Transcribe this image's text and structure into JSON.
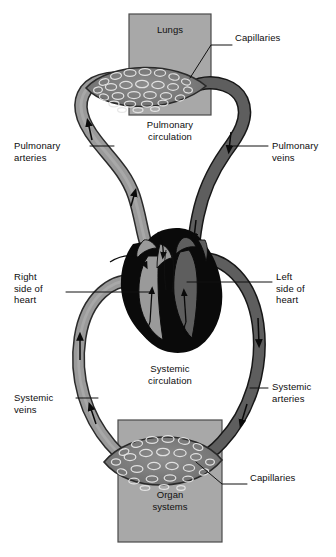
{
  "figure": {
    "type": "anatomical-flow-diagram"
  },
  "colors": {
    "oxygen_poor_blue": "#9a9a9a",
    "oxygen_rich_red": "#5e5e5e",
    "heart_dark": "#0a0a0a",
    "organ_box_fill": "#a8a8a8",
    "organ_box_stroke": "#4a4a4a",
    "capillary_bed_fill": "#7d7d7d",
    "text": "#0d0d0d",
    "leader_line": "#111111",
    "background": "#ffffff"
  },
  "boxes": [
    {
      "name": "lungs-box",
      "label": "Lungs",
      "x": 129,
      "y": 14,
      "w": 82,
      "h": 101
    },
    {
      "name": "organ-systems-box",
      "label": "Organ\nsystems",
      "x": 118,
      "y": 420,
      "w": 104,
      "h": 122
    }
  ],
  "circulation_labels": [
    {
      "name": "pulmonary-circulation-label",
      "text": "Pulmonary\ncirculation",
      "x": 132,
      "y": 119,
      "w": 76
    },
    {
      "name": "systemic-circulation-label",
      "text": "Systemic\ncirculation",
      "x": 132,
      "y": 363,
      "w": 76
    }
  ],
  "callouts": [
    {
      "name": "capillaries-lungs",
      "text": "Capillaries",
      "side": "right",
      "text_x": 235,
      "text_y": 38,
      "leader": [
        [
          232,
          45
        ],
        [
          211,
          45
        ],
        [
          190,
          78
        ]
      ]
    },
    {
      "name": "pulmonary-arteries",
      "text": "Pulmonary\narteries",
      "side": "left",
      "text_x": 14,
      "text_y": 140,
      "text_w": 74,
      "leader": [
        [
          90,
          146
        ],
        [
          114,
          146
        ]
      ]
    },
    {
      "name": "pulmonary-veins",
      "text": "Pulmonary\nveins",
      "side": "right",
      "text_x": 272,
      "text_y": 140,
      "text_w": 62,
      "leader": [
        [
          268,
          146
        ],
        [
          231,
          146
        ]
      ]
    },
    {
      "name": "right-side-of-heart",
      "text": "Right\nside of\nheart",
      "side": "left",
      "text_x": 14,
      "text_y": 271,
      "text_w": 52,
      "leader": [
        [
          68,
          292
        ],
        [
          150,
          292
        ]
      ]
    },
    {
      "name": "left-side-of-heart",
      "text": "Left\nside of\nheart",
      "side": "right",
      "text_x": 276,
      "text_y": 271,
      "text_w": 56,
      "leader": [
        [
          272,
          282
        ],
        [
          187,
          282
        ]
      ]
    },
    {
      "name": "systemic-veins",
      "text": "Systemic\nveins",
      "side": "left",
      "text_x": 14,
      "text_y": 392,
      "text_w": 62,
      "leader": [
        [
          78,
          398
        ],
        [
          98,
          398
        ]
      ]
    },
    {
      "name": "systemic-arteries",
      "text": "Systemic\narteries",
      "side": "right",
      "text_x": 272,
      "text_y": 381,
      "text_w": 62,
      "leader": [
        [
          268,
          388
        ],
        [
          250,
          388
        ]
      ]
    },
    {
      "name": "capillaries-organs",
      "text": "Capillaries",
      "side": "right",
      "text_x": 250,
      "text_y": 478,
      "leader": [
        [
          247,
          484
        ],
        [
          222,
          484
        ],
        [
          196,
          462
        ]
      ]
    }
  ],
  "flow_arrows": [
    {
      "name": "arrow-pulmonary-artery-up",
      "note": "upward flow in left (oxygen-poor) pulmonary vessel"
    },
    {
      "name": "arrow-pulmonary-vein-down",
      "note": "downward flow in right (oxygen-rich) pulmonary vessel"
    },
    {
      "name": "arrow-systemic-vein-up",
      "note": "upward flow in left systemic vessel toward right heart"
    },
    {
      "name": "arrow-systemic-artery-down",
      "note": "downward flow in right systemic vessel toward organs"
    }
  ]
}
